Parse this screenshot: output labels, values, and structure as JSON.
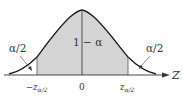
{
  "diagram": {
    "type": "normal-distribution-two-tailed",
    "center_label": "1 − α",
    "left_tail_label": "α/2",
    "right_tail_label": "α/2",
    "axis_label": "Z",
    "ticks": {
      "left": "−z",
      "left_sub": "α/2",
      "center": "0",
      "right": "z",
      "right_sub": "α/2"
    },
    "colors": {
      "shaded": "#d4d4d4",
      "curve": "#1a1a1a",
      "axis": "#333333",
      "text": "#333333"
    }
  }
}
